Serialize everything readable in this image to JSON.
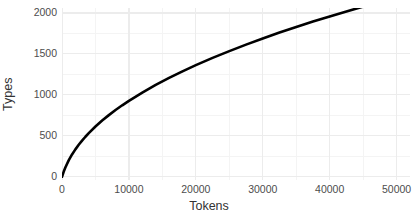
{
  "chart_data": {
    "type": "line",
    "title": "",
    "subtitle": "",
    "xlabel": "Tokens",
    "ylabel": "Types",
    "xlim": [
      0,
      52000
    ],
    "ylim": [
      -40,
      2060
    ],
    "grid": true,
    "legend": "none",
    "x_ticks": [
      0,
      10000,
      20000,
      30000,
      40000,
      50000
    ],
    "x_tick_labels": [
      "0",
      "10000",
      "20000",
      "30000",
      "40000",
      "50000"
    ],
    "y_ticks": [
      0,
      500,
      1000,
      1500,
      2000
    ],
    "y_tick_labels": [
      "0",
      "500",
      "1000",
      "1500",
      "2000"
    ],
    "x_minor_ticks": [
      5000,
      15000,
      25000,
      35000,
      45000
    ],
    "y_minor_ticks": [
      250,
      750,
      1250,
      1750
    ],
    "series": [
      {
        "name": "types-vs-tokens",
        "color": "#000000",
        "line_width": 2.6,
        "x": [
          0,
          250,
          500,
          1000,
          1500,
          2000,
          2500,
          3000,
          3500,
          4000,
          5000,
          6000,
          7000,
          8000,
          9000,
          10000,
          12000,
          14000,
          16000,
          18000,
          20000,
          22500,
          25000,
          27500,
          30000,
          32500,
          35000,
          37500,
          40000,
          42500,
          45000,
          47500,
          50000
        ],
        "y": [
          0,
          60,
          112,
          200,
          272,
          334,
          390,
          441,
          488,
          532,
          613,
          686,
          752,
          814,
          872,
          927,
          1028,
          1121,
          1207,
          1287,
          1362,
          1451,
          1534,
          1613,
          1688,
          1760,
          1828,
          1894,
          1957,
          2018,
          2077,
          2134,
          2190
        ]
      }
    ]
  },
  "axis": {
    "x_title": "Tokens",
    "y_title": "Types"
  }
}
